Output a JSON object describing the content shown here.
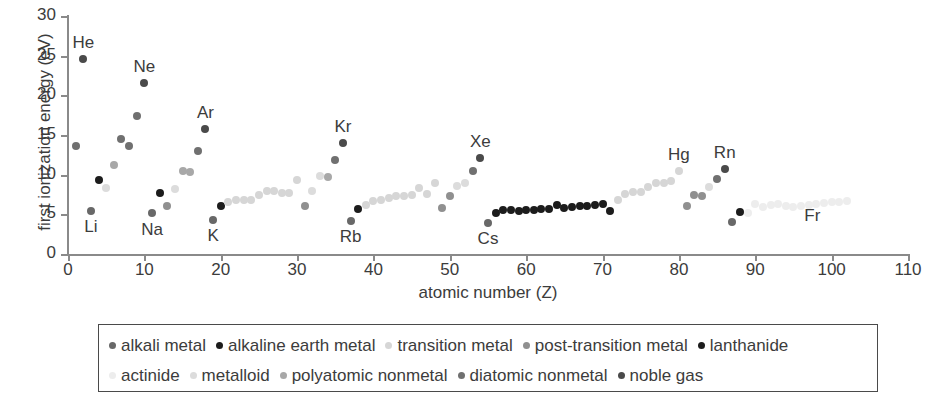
{
  "chart_data": {
    "type": "scatter",
    "title": "",
    "xlabel": "atomic number (Z)",
    "ylabel": "first ionization energy (eV)",
    "xlim": [
      0,
      110
    ],
    "ylim": [
      0,
      30
    ],
    "xticks": [
      0,
      10,
      20,
      30,
      40,
      50,
      60,
      70,
      80,
      90,
      100,
      110
    ],
    "yticks": [
      0,
      5,
      10,
      15,
      20,
      25,
      30
    ],
    "grid": false,
    "legend_position": "below-plot",
    "point_labels": [
      {
        "text": "He",
        "x": 2,
        "y": 24.6
      },
      {
        "text": "Li",
        "x": 3,
        "y": 5.4
      },
      {
        "text": "Ne",
        "x": 10,
        "y": 21.6
      },
      {
        "text": "Na",
        "x": 11,
        "y": 5.1
      },
      {
        "text": "Ar",
        "x": 18,
        "y": 15.8
      },
      {
        "text": "K",
        "x": 19,
        "y": 4.3
      },
      {
        "text": "Kr",
        "x": 36,
        "y": 14.0
      },
      {
        "text": "Rb",
        "x": 37,
        "y": 4.2
      },
      {
        "text": "Xe",
        "x": 54,
        "y": 12.1
      },
      {
        "text": "Cs",
        "x": 55,
        "y": 3.9
      },
      {
        "text": "Hg",
        "x": 80,
        "y": 10.4
      },
      {
        "text": "Rn",
        "x": 86,
        "y": 10.7
      },
      {
        "text": "Fr",
        "x": 87,
        "y": 4.1
      }
    ],
    "series": [
      {
        "name": "alkali metal",
        "color": "#686868",
        "points": [
          {
            "z": 3,
            "e": 5.39
          },
          {
            "z": 11,
            "e": 5.14
          },
          {
            "z": 19,
            "e": 4.34
          },
          {
            "z": 37,
            "e": 4.18
          },
          {
            "z": 55,
            "e": 3.89
          },
          {
            "z": 87,
            "e": 4.07
          }
        ]
      },
      {
        "name": "alkaline earth metal",
        "color": "#1c1c1c",
        "points": [
          {
            "z": 4,
            "e": 9.32
          },
          {
            "z": 12,
            "e": 7.65
          },
          {
            "z": 20,
            "e": 6.11
          },
          {
            "z": 38,
            "e": 5.69
          },
          {
            "z": 56,
            "e": 5.21
          },
          {
            "z": 88,
            "e": 5.28
          }
        ]
      },
      {
        "name": "transition metal",
        "color": "#d6d6d6",
        "points": [
          {
            "z": 21,
            "e": 6.56
          },
          {
            "z": 22,
            "e": 6.83
          },
          {
            "z": 23,
            "e": 6.75
          },
          {
            "z": 24,
            "e": 6.77
          },
          {
            "z": 25,
            "e": 7.43
          },
          {
            "z": 26,
            "e": 7.9
          },
          {
            "z": 27,
            "e": 7.88
          },
          {
            "z": 28,
            "e": 7.64
          },
          {
            "z": 29,
            "e": 7.73
          },
          {
            "z": 30,
            "e": 9.39
          },
          {
            "z": 39,
            "e": 6.22
          },
          {
            "z": 40,
            "e": 6.63
          },
          {
            "z": 41,
            "e": 6.76
          },
          {
            "z": 42,
            "e": 7.09
          },
          {
            "z": 43,
            "e": 7.28
          },
          {
            "z": 44,
            "e": 7.36
          },
          {
            "z": 45,
            "e": 7.46
          },
          {
            "z": 46,
            "e": 8.34
          },
          {
            "z": 47,
            "e": 7.58
          },
          {
            "z": 48,
            "e": 8.99
          },
          {
            "z": 72,
            "e": 6.83
          },
          {
            "z": 73,
            "e": 7.55
          },
          {
            "z": 74,
            "e": 7.86
          },
          {
            "z": 75,
            "e": 7.83
          },
          {
            "z": 76,
            "e": 8.44
          },
          {
            "z": 77,
            "e": 8.97
          },
          {
            "z": 78,
            "e": 8.96
          },
          {
            "z": 79,
            "e": 9.23
          },
          {
            "z": 80,
            "e": 10.44
          }
        ]
      },
      {
        "name": "post-transition metal",
        "color": "#909090",
        "points": [
          {
            "z": 13,
            "e": 5.99
          },
          {
            "z": 31,
            "e": 6.0
          },
          {
            "z": 49,
            "e": 5.79
          },
          {
            "z": 50,
            "e": 7.34
          },
          {
            "z": 81,
            "e": 6.11
          },
          {
            "z": 82,
            "e": 7.42
          },
          {
            "z": 83,
            "e": 7.29
          }
        ]
      },
      {
        "name": "lanthanide",
        "color": "#1c1c1c",
        "points": [
          {
            "z": 57,
            "e": 5.58
          },
          {
            "z": 58,
            "e": 5.54
          },
          {
            "z": 59,
            "e": 5.47
          },
          {
            "z": 60,
            "e": 5.53
          },
          {
            "z": 61,
            "e": 5.58
          },
          {
            "z": 62,
            "e": 5.64
          },
          {
            "z": 63,
            "e": 5.67
          },
          {
            "z": 64,
            "e": 6.15
          },
          {
            "z": 65,
            "e": 5.86
          },
          {
            "z": 66,
            "e": 5.94
          },
          {
            "z": 67,
            "e": 6.02
          },
          {
            "z": 68,
            "e": 6.11
          },
          {
            "z": 69,
            "e": 6.18
          },
          {
            "z": 70,
            "e": 6.25
          },
          {
            "z": 71,
            "e": 5.43
          }
        ]
      },
      {
        "name": "actinide",
        "color": "#ededed",
        "points": [
          {
            "z": 89,
            "e": 5.17
          },
          {
            "z": 90,
            "e": 6.31
          },
          {
            "z": 91,
            "e": 5.89
          },
          {
            "z": 92,
            "e": 6.19
          },
          {
            "z": 93,
            "e": 6.27
          },
          {
            "z": 94,
            "e": 6.03
          },
          {
            "z": 95,
            "e": 5.97
          },
          {
            "z": 96,
            "e": 5.99
          },
          {
            "z": 97,
            "e": 6.2
          },
          {
            "z": 98,
            "e": 6.28
          },
          {
            "z": 99,
            "e": 6.37
          },
          {
            "z": 100,
            "e": 6.5
          },
          {
            "z": 101,
            "e": 6.58
          },
          {
            "z": 102,
            "e": 6.65
          }
        ]
      },
      {
        "name": "metalloid",
        "color": "#dcdcdc",
        "points": [
          {
            "z": 5,
            "e": 8.3
          },
          {
            "z": 14,
            "e": 8.15
          },
          {
            "z": 32,
            "e": 7.9
          },
          {
            "z": 33,
            "e": 9.79
          },
          {
            "z": 51,
            "e": 8.61
          },
          {
            "z": 52,
            "e": 9.01
          },
          {
            "z": 84,
            "e": 8.42
          }
        ]
      },
      {
        "name": "polyatomic nonmetal",
        "color": "#a8a8a8",
        "points": [
          {
            "z": 6,
            "e": 11.26
          },
          {
            "z": 15,
            "e": 10.49
          },
          {
            "z": 16,
            "e": 10.36
          },
          {
            "z": 34,
            "e": 9.75
          }
        ]
      },
      {
        "name": "diatomic nonmetal",
        "color": "#707070",
        "points": [
          {
            "z": 1,
            "e": 13.6
          },
          {
            "z": 7,
            "e": 14.53
          },
          {
            "z": 8,
            "e": 13.62
          },
          {
            "z": 9,
            "e": 17.42
          },
          {
            "z": 17,
            "e": 12.97
          },
          {
            "z": 35,
            "e": 11.81
          },
          {
            "z": 53,
            "e": 10.45
          },
          {
            "z": 85,
            "e": 9.5
          }
        ]
      },
      {
        "name": "noble gas",
        "color": "#4a4a4a",
        "points": [
          {
            "z": 2,
            "e": 24.59
          },
          {
            "z": 10,
            "e": 21.56
          },
          {
            "z": 18,
            "e": 15.76
          },
          {
            "z": 36,
            "e": 14.0
          },
          {
            "z": 54,
            "e": 12.13
          },
          {
            "z": 86,
            "e": 10.75
          }
        ]
      }
    ]
  },
  "legend": {
    "rows": [
      [
        {
          "label": "alkali metal",
          "color": "#686868"
        },
        {
          "label": "alkaline earth metal",
          "color": "#1c1c1c"
        },
        {
          "label": "transition metal",
          "color": "#d6d6d6"
        },
        {
          "label": "post-transition metal",
          "color": "#909090"
        },
        {
          "label": "lanthanide",
          "color": "#1c1c1c"
        }
      ],
      [
        {
          "label": "actinide",
          "color": "#ededed"
        },
        {
          "label": "metalloid",
          "color": "#dcdcdc"
        },
        {
          "label": "polyatomic nonmetal",
          "color": "#a8a8a8"
        },
        {
          "label": "diatomic nonmetal",
          "color": "#707070"
        },
        {
          "label": "noble gas",
          "color": "#4a4a4a"
        }
      ]
    ]
  },
  "axes": {
    "x_title": "atomic number (Z)",
    "y_title": "first ionization energy (eV)"
  }
}
